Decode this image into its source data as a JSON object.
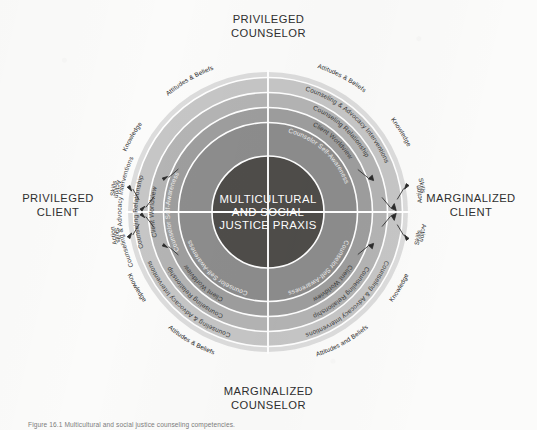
{
  "figure": {
    "caption": "Figure 16.1 Multicultural and social justice counseling competencies.",
    "core_lines": [
      "MULTICULTURAL",
      "AND SOCIAL",
      "JUSTICE PRAXIS"
    ]
  },
  "axis_labels": {
    "top": "PRIVILEGED\nCOUNSELOR",
    "bottom": "MARGINALIZED\nCOUNSELOR",
    "left": "PRIVILEGED\nCLIENT",
    "right": "MARGINALIZED\nCLIENT"
  },
  "rings": [
    {
      "id": "counselor-self-awareness",
      "label": "Counselor Self-Awareness",
      "color": "#8d8d8d",
      "text_tone": "light"
    },
    {
      "id": "client-worldview",
      "label": "Client Worldview",
      "color": "#9e9e9e",
      "text_tone": "dark"
    },
    {
      "id": "counseling-relationship",
      "label": "Counseling Relationship",
      "color": "#b4b4b4",
      "text_tone": "dark"
    },
    {
      "id": "counseling-advocacy-interventions",
      "label": "Counseling & Advocacy Interventions",
      "color": "#c6c6c6",
      "text_tone": "dark"
    },
    {
      "id": "developmental-domains-band",
      "label": "",
      "color": "#dcdcdc",
      "text_tone": "dark"
    }
  ],
  "core": {
    "color": "#4f4d4a"
  },
  "quadrants": [
    {
      "id": "privileged-counselor-privileged-client",
      "position": "top-left",
      "ring_labels": [
        "Counselor Self-Awareness",
        "Client Worldview",
        "Counseling Relationship",
        "Counseling & Advocacy Interventions"
      ],
      "competency_arc": [
        "Attitudes & Beliefs",
        "Knowledge",
        "Skills",
        "Action"
      ]
    },
    {
      "id": "privileged-counselor-marginalized-client",
      "position": "top-right",
      "ring_labels": [
        "Counselor Self-Awareness",
        "Client Worldview",
        "Counseling Relationship",
        "Counseling & Advocacy Interventions"
      ],
      "competency_arc": [
        "Attitudes & Beliefs",
        "Knowledge",
        "Skills",
        "Action"
      ]
    },
    {
      "id": "marginalized-counselor-privileged-client",
      "position": "bottom-left",
      "ring_labels": [
        "Counselor Self-Awareness",
        "Client Worldview",
        "Counseling Relationship",
        "Counseling & Advocacy Interventions"
      ],
      "competency_arc": [
        "Attitudes & Beliefs",
        "Knowledge",
        "Skills",
        "Action"
      ]
    },
    {
      "id": "marginalized-counselor-marginalized-client",
      "position": "bottom-right",
      "ring_labels": [
        "Counselor Self-Awareness",
        "Client Worldview",
        "Counseling Relationship",
        "Counseling & Advocacy Interventions"
      ],
      "competency_arc": [
        "Attitudes and Beliefs",
        "Knowledge",
        "Skills",
        "Action"
      ]
    }
  ]
}
